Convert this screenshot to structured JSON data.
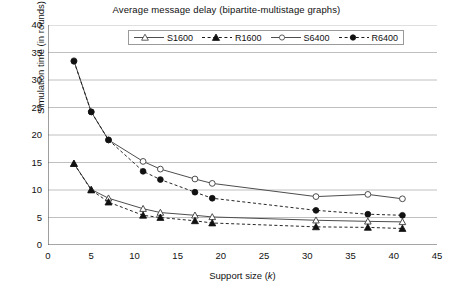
{
  "chart_data": {
    "type": "line",
    "title": "Average message delay (bipartite-multistage graphs)",
    "xlabel": "Support size (k)",
    "ylabel": "Simulation time (in rounds)",
    "xlim": [
      0,
      45
    ],
    "ylim": [
      0,
      40
    ],
    "xticks": [
      0,
      5,
      10,
      15,
      20,
      25,
      30,
      35,
      40,
      45
    ],
    "yticks": [
      0,
      5,
      10,
      15,
      20,
      25,
      30,
      35,
      40
    ],
    "grid": "horizontal",
    "legend_position": "top-center-inside",
    "series": [
      {
        "name": "S1600",
        "line": "solid",
        "marker": "open-triangle",
        "color": "#4d4d4d",
        "x": [
          3,
          5,
          7,
          11,
          13,
          17,
          19,
          31,
          37,
          41
        ],
        "y": [
          14.8,
          10.1,
          8.5,
          6.6,
          5.9,
          5.4,
          5.1,
          4.5,
          4.3,
          4.2
        ]
      },
      {
        "name": "R1600",
        "line": "dashed",
        "marker": "filled-triangle",
        "color": "#1a1a1a",
        "x": [
          3,
          5,
          7,
          11,
          13,
          17,
          19,
          31,
          37,
          41
        ],
        "y": [
          14.8,
          10.0,
          7.8,
          5.4,
          5.0,
          4.4,
          4.0,
          3.3,
          3.2,
          3.0
        ]
      },
      {
        "name": "S6400",
        "line": "solid",
        "marker": "open-circle",
        "color": "#4d4d4d",
        "x": [
          3,
          5,
          7,
          11,
          13,
          17,
          19,
          31,
          37,
          41
        ],
        "y": [
          33.5,
          24.2,
          19.1,
          15.2,
          13.8,
          12.0,
          11.2,
          8.8,
          9.2,
          8.4
        ]
      },
      {
        "name": "R6400",
        "line": "dashed",
        "marker": "filled-circle",
        "color": "#1a1a1a",
        "x": [
          3,
          5,
          7,
          11,
          13,
          17,
          19,
          31,
          37,
          41
        ],
        "y": [
          33.4,
          24.2,
          19.1,
          13.4,
          11.9,
          9.6,
          8.5,
          6.3,
          5.6,
          5.4
        ]
      }
    ]
  },
  "legend": {
    "items": [
      {
        "label": "S1600"
      },
      {
        "label": "R1600"
      },
      {
        "label": "S6400"
      },
      {
        "label": "R6400"
      }
    ]
  },
  "axes": {
    "x_title_text": "Support size (",
    "x_title_var": "k",
    "x_title_close": ")",
    "y_title": "Simulation time (in rounds)"
  },
  "colors": {
    "grid": "#b0b0b0",
    "axis": "#4d4d4d",
    "solid_series": "#4d4d4d",
    "dashed_series": "#1a1a1a",
    "background": "#ffffff"
  }
}
